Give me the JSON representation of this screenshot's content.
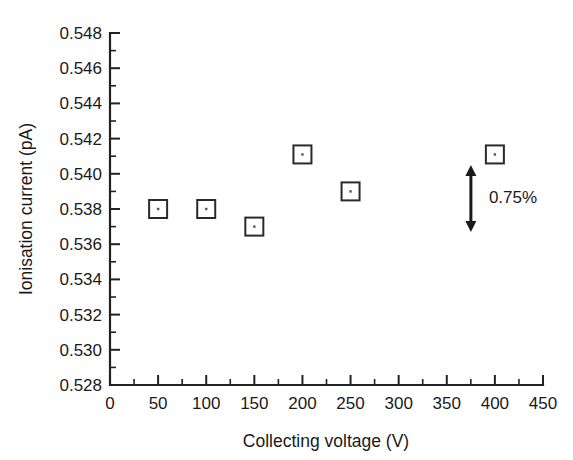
{
  "chart_data": {
    "type": "scatter",
    "title": "",
    "xlabel": "Collecting voltage (V)",
    "ylabel": "Ionisation current (pA)",
    "xlim": [
      0,
      450
    ],
    "ylim": [
      0.528,
      0.548
    ],
    "xticks": [
      0,
      50,
      100,
      150,
      200,
      250,
      300,
      350,
      400,
      450
    ],
    "xtick_labels": [
      "0",
      "50",
      "100",
      "150",
      "200",
      "250",
      "300",
      "350",
      "400",
      "450"
    ],
    "x_minor_tick_step": 25,
    "yticks": [
      0.528,
      0.53,
      0.532,
      0.534,
      0.536,
      0.538,
      0.54,
      0.542,
      0.544,
      0.546,
      0.548
    ],
    "ytick_labels": [
      "0.528",
      "0.530",
      "0.532",
      "0.534",
      "0.536",
      "0.538",
      "0.540",
      "0.542",
      "0.544",
      "0.546",
      "0.548"
    ],
    "y_minor_tick_step": 0.001,
    "grid": false,
    "legend": null,
    "marker": "open-square-with-center-dot",
    "series": [
      {
        "name": "Ionisation current",
        "x": [
          50,
          100,
          150,
          200,
          250,
          400
        ],
        "values": [
          0.538,
          0.538,
          0.537,
          0.5411,
          0.539,
          0.5411
        ]
      }
    ],
    "annotations": [
      {
        "name": "scale-bar",
        "label": "0.75%",
        "type": "double-headed-vertical-arrow",
        "x": 400,
        "y_top": 0.5405,
        "y_bottom": 0.5367,
        "label_x": 420,
        "label_y": 0.5387
      }
    ]
  },
  "axes": {
    "x_title": "Collecting voltage (V)",
    "y_title": "Ionisation current (pA)"
  },
  "annotation": {
    "percent_label": "0.75%"
  }
}
